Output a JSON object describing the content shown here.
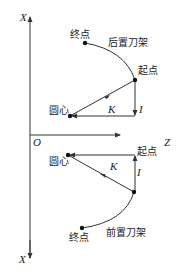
{
  "axes": {
    "x_top_label": "X",
    "x_bottom_label": "X",
    "z_label": "Z",
    "origin_label": "O"
  },
  "rear_tool_post": {
    "title": "后置刀架",
    "end_point": "终点",
    "start_point": "起点",
    "center": "圆心",
    "vector_k": "K",
    "vector_i": "I"
  },
  "front_tool_post": {
    "title": "前置刀架",
    "end_point": "终点",
    "start_point": "起点",
    "center": "圆心",
    "vector_k": "K",
    "vector_i": "I"
  },
  "colors": {
    "line": "#333333",
    "background": "#ffffff"
  }
}
